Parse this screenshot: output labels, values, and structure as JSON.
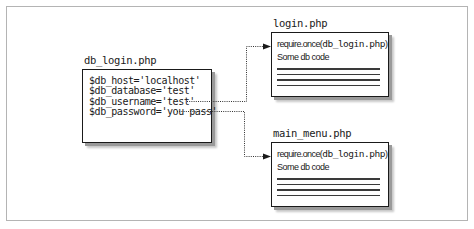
{
  "diagram": {
    "source_file": {
      "label": "db_login.php",
      "lines": [
        "$db_host='localhost'",
        "$db_database='test'",
        "$db_username='test'",
        "$db_password='you pass'"
      ]
    },
    "targets": [
      {
        "label": "login.php",
        "require_prefix": "require.once(",
        "require_file": "db_login.php",
        "require_suffix": ")",
        "body_text": "Some db code",
        "placeholder_lines": 4
      },
      {
        "label": "main_menu.php",
        "require_prefix": "require.once(",
        "require_file": "db_login.php",
        "require_suffix": ")",
        "body_text": "Some db code",
        "placeholder_lines": 4
      }
    ],
    "connectors": [
      {
        "from": "db_login.php",
        "to": "login.php",
        "style": "dotted",
        "arrow": "end"
      },
      {
        "from": "db_login.php",
        "to": "main_menu.php",
        "style": "dotted",
        "arrow": "end"
      }
    ],
    "colors": {
      "frame_border": "#b4b4b4",
      "box_border": "#1a1a1a",
      "shadow": "#9a9a9a",
      "text": "#1a1a1a",
      "connector": "#333333"
    }
  }
}
